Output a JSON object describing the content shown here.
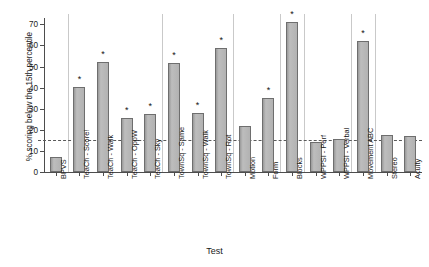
{
  "chart_data": {
    "type": "bar",
    "title": "",
    "xlabel": "Test",
    "ylabel": "% scoring below the 15th percentile",
    "ylim": [
      0,
      73
    ],
    "yticks": [
      0,
      10,
      20,
      30,
      40,
      50,
      60,
      70
    ],
    "grid": false,
    "legend": null,
    "reference_line": {
      "value": 15,
      "style": "dashed",
      "label": ""
    },
    "categories": [
      "BPVS",
      "TeaCh - Score!",
      "TeaCh - Walk",
      "TeaCh - OppW",
      "TeaCh - Sky",
      "TownSq - Same",
      "TownSq - Walk",
      "TownSq - Rot",
      "Motion",
      "Form",
      "Blocks",
      "WPPSI - Perf",
      "WPPSI - Verbal",
      "Movement ABC",
      "Stereo",
      "Acuity"
    ],
    "values": [
      7,
      40.5,
      52,
      25.5,
      27.5,
      51.5,
      28,
      59,
      22,
      35,
      71,
      14,
      15.5,
      62,
      17.5,
      17
    ],
    "annotations": [
      {
        "category": "TeaCh - Score!",
        "marker": "*"
      },
      {
        "category": "TeaCh - Walk",
        "marker": "*"
      },
      {
        "category": "TeaCh - OppW",
        "marker": "*"
      },
      {
        "category": "TeaCh - Sky",
        "marker": "*"
      },
      {
        "category": "TownSq - Same",
        "marker": "*"
      },
      {
        "category": "TownSq - Walk",
        "marker": "*"
      },
      {
        "category": "TownSq - Rot",
        "marker": "*"
      },
      {
        "category": "Form",
        "marker": "*"
      },
      {
        "category": "Blocks",
        "marker": "*"
      },
      {
        "category": "Movement ABC",
        "marker": "*"
      }
    ],
    "group_separators_after": [
      "BPVS",
      "TeaCh - Sky",
      "TownSq - Rot",
      "Form",
      "Blocks",
      "WPPSI - Verbal",
      "Movement ABC"
    ],
    "colors": {
      "bar_fill": "#b0b0b0",
      "bar_edge": "#6e6e6e",
      "axis": "#4d4d4d",
      "reference_line": "#5a5a5a",
      "separator": "#c9c9c9",
      "text": "#1a1a1a",
      "background": "#ffffff"
    }
  }
}
